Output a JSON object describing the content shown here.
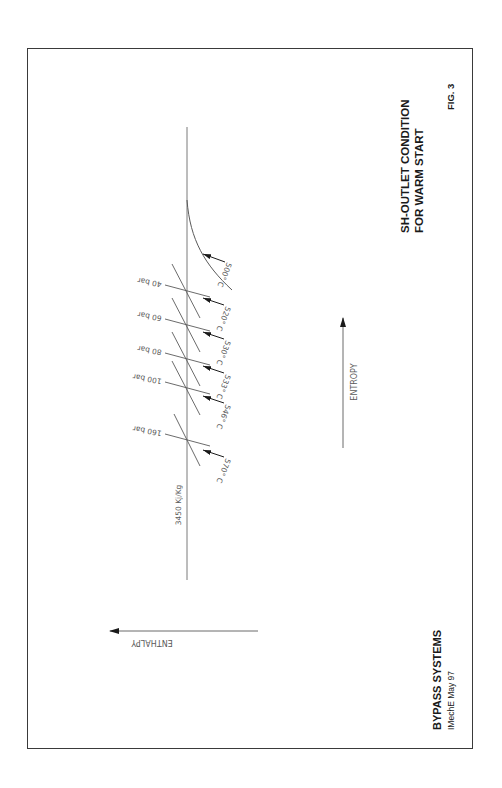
{
  "figure": {
    "title_line1": "SH-OUTLET CONDITION",
    "title_line2": "FOR WARM START",
    "fig_label": "FIG. 3",
    "footer_title": "BYPASS SYSTEMS",
    "footer_subtitle": "IMechE  May 97"
  },
  "axes": {
    "entropy_label": "ENTROPY",
    "enthalpy_label": "ENTHALPY",
    "enthalpy_line_label": "3450 Kj/Kg"
  },
  "isobars": [
    {
      "label": "40 bar",
      "pressure_bar": 40
    },
    {
      "label": "60 bar",
      "pressure_bar": 60
    },
    {
      "label": "80 bar",
      "pressure_bar": 80
    },
    {
      "label": "100 bar",
      "pressure_bar": 100
    },
    {
      "label": "160 bar",
      "pressure_bar": 160
    }
  ],
  "temperatures": [
    {
      "label": "500° C",
      "value_c": 500
    },
    {
      "label": "520° C",
      "value_c": 520
    },
    {
      "label": "530° C",
      "value_c": 530
    },
    {
      "label": "533° C",
      "value_c": 533
    },
    {
      "label": "546° C",
      "value_c": 546
    },
    {
      "label": "570° C",
      "value_c": 570
    }
  ],
  "colors": {
    "line": "#6a6a6a",
    "text": "#1a1a1a",
    "frame": "#3a3a3a"
  }
}
